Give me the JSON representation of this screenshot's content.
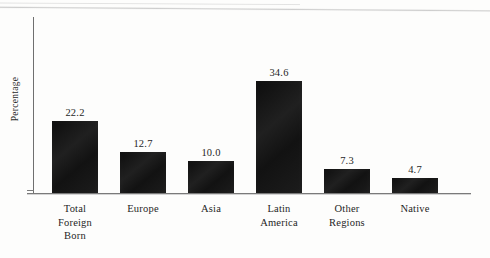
{
  "chart_data": {
    "type": "bar",
    "title": "",
    "subtitle": "",
    "xlabel": "",
    "ylabel": "Percentage",
    "ylim": [
      0,
      40
    ],
    "grid": false,
    "legend": null,
    "orientation": "vertical",
    "bar_color": "#151515",
    "axis_color": "#6f6f6f",
    "text_color": "#1f1f1f",
    "background": "#fdfdfc",
    "value_label_format": "one-decimal",
    "categories": [
      "Total Foreign Born",
      "Europe",
      "Asia",
      "Latin America",
      "Other Regions",
      "Native"
    ],
    "values": [
      22.2,
      12.7,
      10.0,
      34.6,
      7.3,
      4.7
    ],
    "bars": [
      {
        "category": "Total Foreign Born",
        "category_lines": [
          "Total",
          "Foreign",
          "Born"
        ],
        "value": 22.2,
        "value_label": "22.2"
      },
      {
        "category": "Europe",
        "category_lines": [
          "Europe"
        ],
        "value": 12.7,
        "value_label": "12.7"
      },
      {
        "category": "Asia",
        "category_lines": [
          "Asia"
        ],
        "value": 10.0,
        "value_label": "10.0"
      },
      {
        "category": "Latin America",
        "category_lines": [
          "Latin",
          "America"
        ],
        "value": 34.6,
        "value_label": "34.6"
      },
      {
        "category": "Other Regions",
        "category_lines": [
          "Other",
          "Regions"
        ],
        "value": 7.3,
        "value_label": "7.3"
      },
      {
        "category": "Native",
        "category_lines": [
          "Native"
        ],
        "value": 4.7,
        "value_label": "4.7"
      }
    ]
  },
  "axis": {
    "y_title": "Percentage"
  }
}
